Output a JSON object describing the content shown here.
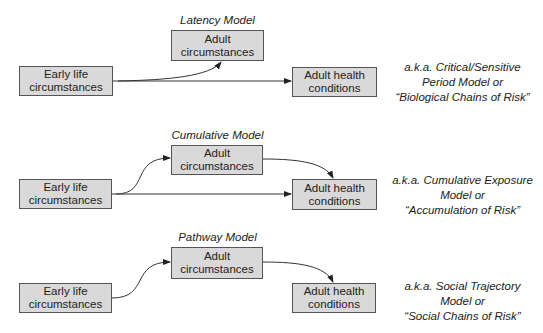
{
  "diagram": {
    "models": [
      {
        "title": "Latency Model",
        "early_box": "Early life\ncircumstances",
        "adult_box": "Adult\ncircumstances",
        "health_box": "Adult health\nconditions",
        "aka": "a.k.a. Critical/Sensitive\nPeriod Model or\n“Biological Chains of Risk”"
      },
      {
        "title": "Cumulative Model",
        "early_box": "Early life\ncircumstances",
        "adult_box": "Adult\ncircumstances",
        "health_box": "Adult health\nconditions",
        "aka": "a.k.a. Cumulative Exposure\nModel or\n“Accumulation of Risk”"
      },
      {
        "title": "Pathway Model",
        "early_box": "Early life\ncircumstances",
        "adult_box": "Adult\ncircumstances",
        "health_box": "Adult health\nconditions",
        "aka": "a.k.a. Social Trajectory\nModel or\n“Social Chains of Risk”"
      }
    ],
    "colors": {
      "box_fill": "#d9d9d9",
      "box_border": "#555555",
      "line": "#333333"
    }
  }
}
